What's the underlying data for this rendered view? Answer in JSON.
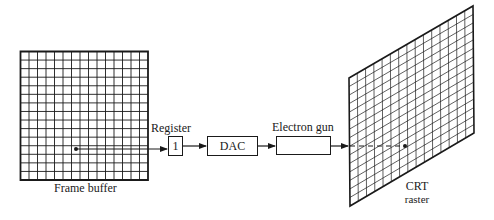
{
  "diagram": {
    "type": "block-diagram",
    "colors": {
      "stroke": "#1a1a1a",
      "background": "#ffffff"
    },
    "frame_buffer": {
      "label": "Frame buffer",
      "grid_columns": 15,
      "grid_rows": 15
    },
    "register": {
      "label": "Register",
      "value": "1"
    },
    "dac": {
      "label": "DAC"
    },
    "electron_gun": {
      "label": "Electron gun"
    },
    "crt_raster": {
      "label_line1": "CRT",
      "label_line2": "raster",
      "grid_columns": 15,
      "grid_rows": 15
    },
    "connections": [
      {
        "from": "frame_buffer_pixel",
        "to": "register",
        "style": "solid-arrow"
      },
      {
        "from": "register",
        "to": "dac",
        "style": "solid-arrow"
      },
      {
        "from": "dac",
        "to": "electron_gun",
        "style": "solid-arrow"
      },
      {
        "from": "electron_gun",
        "to": "crt_raster",
        "style": "solid-arrow"
      },
      {
        "from": "crt_raster_edge",
        "to": "crt_raster_pixel",
        "style": "dashed"
      }
    ]
  }
}
